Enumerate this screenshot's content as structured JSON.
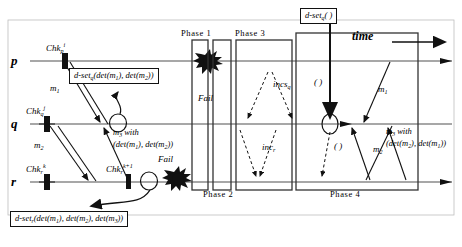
{
  "diagram": {
    "processes": [
      {
        "id": "p",
        "label": "p",
        "y": 61
      },
      {
        "id": "q",
        "label": "q",
        "y": 124
      },
      {
        "id": "r",
        "label": "r",
        "y": 182
      }
    ],
    "checkpoints": [
      {
        "name": "chk-p-i",
        "label": "Chk",
        "sub": "p",
        "sup": "i",
        "x": 46,
        "y": 47
      },
      {
        "name": "chk-q-j",
        "label": "Chk",
        "sub": "q",
        "sup": "j",
        "x": 28,
        "y": 110
      },
      {
        "name": "chk-r-k",
        "label": "Chk",
        "sub": "r",
        "sup": "k",
        "x": 28,
        "y": 168
      },
      {
        "name": "chk-r-k1",
        "label": "Chk",
        "sub": "r",
        "sup": "k+1",
        "x": 108,
        "y": 168
      }
    ],
    "messages": [
      {
        "name": "m1-p-to-q",
        "label": "m",
        "sub": "1",
        "x": 40,
        "y": 84
      },
      {
        "name": "m2-q-to-r",
        "label": "m",
        "sub": "2",
        "x": 32,
        "y": 141
      },
      {
        "name": "m1-right",
        "label": "m",
        "sub": "1",
        "x": 378,
        "y": 88
      },
      {
        "name": "m2-right",
        "label": "m",
        "sub": "2",
        "x": 377,
        "y": 148
      }
    ],
    "annotations": [
      {
        "name": "d-set-q-box-left",
        "text": "d-set",
        "sub": "q",
        "args": "(det(m",
        "sub2": "1",
        "mid": "), det(m",
        "sub3": "2",
        "close": "))",
        "x": 69,
        "y": 70
      },
      {
        "name": "d-set-r-box-bottom",
        "text": "d-set",
        "sub": "r",
        "x": 10,
        "y": 212
      },
      {
        "name": "d-set-q-box-top",
        "text": "d-set",
        "sub": "q",
        "paren": "( )",
        "x": 300,
        "y": 9
      }
    ],
    "inline_labels": [
      {
        "name": "incs-q-label",
        "text": "incs",
        "sub": "q",
        "x": 273,
        "y": 82
      },
      {
        "name": "inc-r-label",
        "text": "inc",
        "sub": "r",
        "x": 262,
        "y": 145
      },
      {
        "name": "empty-paren-upper",
        "text": "( )",
        "x": 316,
        "y": 82
      },
      {
        "name": "empty-paren-lower",
        "text": "( )",
        "x": 337,
        "y": 146
      }
    ],
    "with_labels": [
      {
        "name": "m3-with-left",
        "line1": "m",
        "sub1": "3",
        "suffix1": " with",
        "line2": "(det(m",
        "sub2": "1",
        "mid2": "), det(m",
        "sub3": "2",
        "close2": "))",
        "x": 113,
        "y": 129
      },
      {
        "name": "m3-with-right",
        "line1": "m",
        "sub1": "3",
        "suffix1": " with",
        "line2": "(det(m",
        "sub2": "2",
        "mid2": "), det(m",
        "sub3": "1",
        "close2": "))",
        "x": 386,
        "y": 128
      }
    ],
    "phases": [
      {
        "name": "phase-1-label",
        "label": "Phase 1",
        "x": 181,
        "y": 30
      },
      {
        "name": "phase-3-label",
        "label": "Phase 3",
        "x": 235,
        "y": 30
      },
      {
        "name": "phase-2-label",
        "label": "Phase 2",
        "x": 203,
        "y": 190
      },
      {
        "name": "phase-4-label",
        "label": "Phase 4",
        "x": 330,
        "y": 190
      }
    ],
    "fail_markers": [
      {
        "name": "fail-label-p",
        "label": "Fail",
        "x": 198,
        "y": 97
      },
      {
        "name": "fail-label-r",
        "label": "Fail",
        "x": 160,
        "y": 158
      }
    ],
    "time_label": {
      "name": "time-label",
      "label": "time",
      "x": 352,
      "y": 36
    },
    "colors": {
      "line": "#8a8a8a",
      "stroke": "#111111",
      "fill": "#ffffff",
      "text": "#000000"
    }
  }
}
